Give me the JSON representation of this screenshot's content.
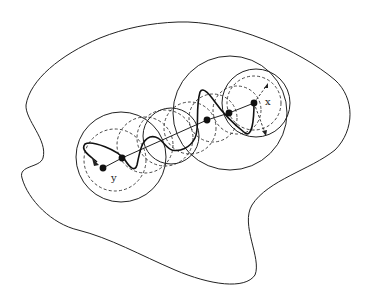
{
  "figure": {
    "labels": {
      "x": "x",
      "y": "y"
    },
    "colors": {
      "stroke": "#222222",
      "background": "#ffffff"
    },
    "points": [
      {
        "name": "y",
        "cx": 103,
        "cy": 168
      },
      {
        "name": "p1",
        "cx": 122,
        "cy": 158
      },
      {
        "name": "p2",
        "cx": 207,
        "cy": 120
      },
      {
        "name": "p3",
        "cx": 229,
        "cy": 113
      },
      {
        "name": "x",
        "cx": 254,
        "cy": 103
      }
    ],
    "solid_circles": [
      {
        "cx": 121,
        "cy": 157,
        "r": 45
      },
      {
        "cx": 171,
        "cy": 136,
        "r": 28
      },
      {
        "cx": 230,
        "cy": 113,
        "r": 57
      },
      {
        "cx": 256,
        "cy": 103,
        "r": 34
      }
    ],
    "dashed_circles": [
      {
        "cx": 115,
        "cy": 160,
        "r": 31
      },
      {
        "cx": 145,
        "cy": 145,
        "r": 28
      },
      {
        "cx": 165,
        "cy": 138,
        "r": 28
      },
      {
        "cx": 190,
        "cy": 128,
        "r": 26
      },
      {
        "cx": 213,
        "cy": 118,
        "r": 24
      },
      {
        "cx": 237,
        "cy": 110,
        "r": 24
      },
      {
        "cx": 254,
        "cy": 103,
        "r": 27
      }
    ]
  }
}
